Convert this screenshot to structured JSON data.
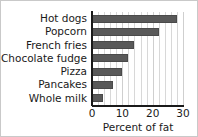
{
  "chart_data": {
    "type": "bar",
    "orientation": "horizontal",
    "title": "",
    "subtitle": "",
    "categories": [
      "Hot dogs",
      "Popcorn",
      "French fries",
      "Chocolate fudge",
      "Pizza",
      "Pancakes",
      "Whole milk"
    ],
    "values": [
      28,
      22,
      14,
      12,
      10,
      7,
      3.5
    ],
    "series": [
      {
        "name": "Percent of fat",
        "values": [
          28,
          22,
          14,
          12,
          10,
          7,
          3.5
        ]
      }
    ],
    "xlabel": "Percent of fat",
    "ylabel": "",
    "xlim": [
      0,
      30
    ],
    "xticks": [
      0,
      10,
      20,
      30
    ],
    "xtick_labels": [
      "0",
      "10",
      "20",
      "30"
    ],
    "minor_tick_step": 2,
    "grid": true,
    "grid_axis": "x",
    "legend": false,
    "legend_position": "none",
    "annotations": []
  },
  "style": {
    "bar_color": "#595959",
    "bar_edge_color": "#4a4a4a",
    "grid_color": "#d8d8d8",
    "axis_color": "#1a1a1a",
    "background": "#ffffff",
    "frame_border": "#c9c9c9",
    "text_color": "#1a1a1a"
  }
}
